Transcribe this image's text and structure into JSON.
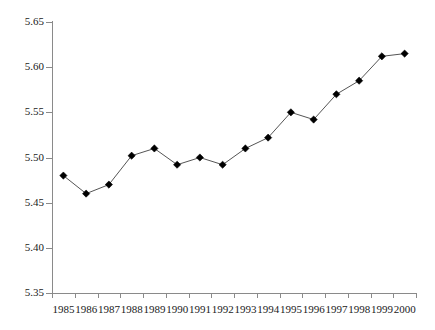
{
  "chart_data": {
    "type": "line",
    "title": "",
    "subtitle": "",
    "xlabel": "",
    "ylabel": "",
    "categories": [
      "1985",
      "1986",
      "1987",
      "1988",
      "1989",
      "1990",
      "1991",
      "1992",
      "1993",
      "1994",
      "1995",
      "1996",
      "1997",
      "1998",
      "1999",
      "2000"
    ],
    "x": [
      1985,
      1986,
      1987,
      1988,
      1989,
      1990,
      1991,
      1992,
      1993,
      1994,
      1995,
      1996,
      1997,
      1998,
      1999,
      2000
    ],
    "values": [
      5.48,
      5.46,
      5.47,
      5.502,
      5.51,
      5.492,
      5.5,
      5.492,
      5.51,
      5.522,
      5.55,
      5.542,
      5.57,
      5.585,
      5.612,
      5.615
    ],
    "series": [
      {
        "name": "series-1",
        "values": [
          5.48,
          5.46,
          5.47,
          5.502,
          5.51,
          5.492,
          5.5,
          5.492,
          5.51,
          5.522,
          5.55,
          5.542,
          5.57,
          5.585,
          5.612,
          5.615
        ],
        "marker": "diamond",
        "marker_color": "#000000",
        "line_color": "#555555"
      }
    ],
    "ylim": [
      5.35,
      5.65
    ],
    "yticks": [
      5.35,
      5.4,
      5.45,
      5.5,
      5.55,
      5.6,
      5.65
    ],
    "ytick_labels": [
      "5.35",
      "5.40",
      "5.45",
      "5.50",
      "5.55",
      "5.60",
      "5.65"
    ],
    "xtick_labels": [
      "1985",
      "1986",
      "1987",
      "1988",
      "1989",
      "1990",
      "1991",
      "1992",
      "1993",
      "1994",
      "1995",
      "1996",
      "1997",
      "1998",
      "1999",
      "2000"
    ],
    "grid": false,
    "legend": null,
    "legend_position": "none",
    "annotations": [],
    "axis_color": "#8a8a8a",
    "background": "#ffffff"
  }
}
